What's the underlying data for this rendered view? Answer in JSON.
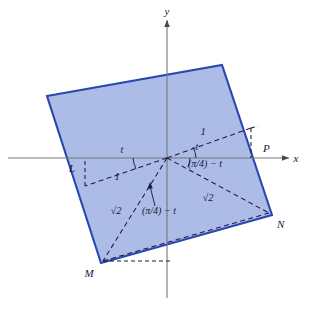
{
  "header": {
    "caption": "Symbolic algebra computer program abstract"
  },
  "figure": {
    "name": "rotated-square-on-axes",
    "colors": {
      "square_fill": "#a9b8e6",
      "square_stroke": "#2a47b0",
      "axis": "#6f6f6f",
      "dashed": "#1a1a40",
      "label": "#15163a",
      "background": "#ffffff"
    },
    "axes": {
      "x_label": "x",
      "y_label": "y",
      "origin": {
        "x": 167,
        "y": 158
      }
    },
    "square": {
      "vertices": [
        {
          "name": "top-left",
          "x": 47,
          "y": 96
        },
        {
          "name": "top-right",
          "x": 222,
          "y": 65
        },
        {
          "name": "N",
          "x": 272,
          "y": 215
        },
        {
          "name": "M",
          "x": 101,
          "y": 263
        }
      ]
    },
    "points": [
      {
        "id": "L",
        "label": "L",
        "x": 77,
        "y": 158,
        "label_x": 72,
        "label_y": 172
      },
      {
        "id": "P",
        "label": "P",
        "x": 258,
        "y": 158,
        "label_x": 263,
        "label_y": 152
      },
      {
        "id": "N",
        "label": "N",
        "x": 272,
        "y": 215,
        "label_x": 277,
        "label_y": 228
      },
      {
        "id": "M",
        "label": "M",
        "x": 101,
        "y": 263,
        "label_x": 89,
        "label_y": 277
      }
    ],
    "annotations": [
      {
        "id": "len-upper-right",
        "text": "1",
        "x": 203,
        "y": 135
      },
      {
        "id": "ang-upper-right",
        "text": "t",
        "x": 197,
        "y": 150
      },
      {
        "id": "ang-lower-right",
        "text": "(π/4) − t",
        "x": 188,
        "y": 165
      },
      {
        "id": "ang-upper-left",
        "text": "t",
        "x": 122,
        "y": 153
      },
      {
        "id": "len-lower-left",
        "text": "1",
        "x": 117,
        "y": 178
      },
      {
        "id": "len-diag-left",
        "text": "√2",
        "x": 116,
        "y": 212
      },
      {
        "id": "ang-diag-left",
        "text": "(π/4) − t",
        "x": 142,
        "y": 213
      },
      {
        "id": "len-diag-right",
        "text": "√2",
        "x": 208,
        "y": 199
      }
    ]
  }
}
